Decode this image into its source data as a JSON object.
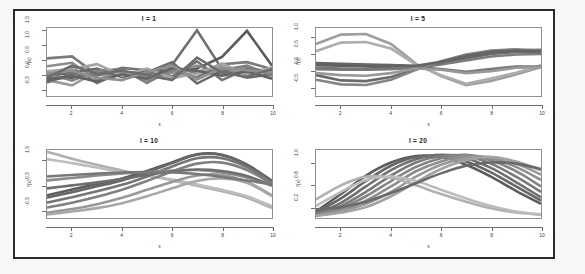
{
  "figure": {
    "layout": "2x2 grid of line plots",
    "background": "#ffffff",
    "frame_color": "#2b2b2b"
  },
  "chart_data": [
    {
      "type": "line",
      "title": "l = 1",
      "xlabel": "x",
      "ylabel": "f(x)",
      "xlim": [
        1,
        10
      ],
      "ylim": [
        -0.75,
        1.6
      ],
      "xticks": [
        "2",
        "4",
        "6",
        "8",
        "10"
      ],
      "xtick_values": [
        2,
        4,
        6,
        8,
        10
      ],
      "yticks": [
        "-0.5",
        "0.0",
        "0.5",
        "1.0",
        "1.5"
      ],
      "ytick_values": [
        -0.5,
        0.0,
        0.5,
        1.0,
        1.5
      ],
      "grid": false,
      "legend": "none",
      "x": [
        1,
        2,
        3,
        4,
        5,
        6,
        7,
        8,
        9,
        10
      ],
      "series": [
        {
          "name": "draw-1",
          "color": "#6f6f6f",
          "values": [
            -0.1,
            0.22,
            -0.3,
            0.1,
            -0.05,
            0.32,
            1.52,
            0.18,
            0.05,
            0.1
          ]
        },
        {
          "name": "draw-2",
          "color": "#5a5a5a",
          "values": [
            -0.15,
            -0.12,
            0.05,
            -0.02,
            0.12,
            0.08,
            0.2,
            0.6,
            1.5,
            0.3
          ]
        },
        {
          "name": "draw-3",
          "color": "#7a7a7a",
          "values": [
            0.55,
            0.62,
            -0.02,
            0.05,
            0.02,
            0.1,
            -0.1,
            0.35,
            0.42,
            0.18
          ]
        },
        {
          "name": "draw-4",
          "color": "#8c8c8c",
          "values": [
            0.28,
            0.4,
            -0.18,
            0.08,
            -0.2,
            0.05,
            0.3,
            0.02,
            0.22,
            0.05
          ]
        },
        {
          "name": "draw-5",
          "color": "#9b9b9b",
          "values": [
            -0.2,
            -0.38,
            0.1,
            0.02,
            -0.08,
            -0.15,
            0.1,
            0.26,
            0.05,
            0.2
          ]
        },
        {
          "name": "draw-6",
          "color": "#6a6a6a",
          "values": [
            -0.05,
            0.05,
            0.2,
            -0.1,
            0.06,
            0.42,
            -0.32,
            0.12,
            -0.12,
            0.0
          ]
        },
        {
          "name": "draw-7",
          "color": "#808080",
          "values": [
            0.05,
            -0.22,
            0.12,
            0.18,
            -0.3,
            0.18,
            0.08,
            0.15,
            0.3,
            -0.05
          ]
        },
        {
          "name": "draw-8",
          "color": "#747474",
          "values": [
            -0.28,
            0.02,
            -0.05,
            0.22,
            0.14,
            -0.08,
            0.45,
            -0.2,
            0.18,
            0.12
          ]
        },
        {
          "name": "draw-9",
          "color": "#a4a4a4",
          "values": [
            0.1,
            0.18,
            0.35,
            -0.05,
            0.2,
            -0.12,
            0.02,
            0.38,
            -0.02,
            0.24
          ]
        },
        {
          "name": "draw-10",
          "color": "#636363",
          "values": [
            -0.22,
            -0.05,
            -0.25,
            0.0,
            -0.15,
            0.22,
            0.12,
            -0.05,
            0.1,
            -0.15
          ]
        },
        {
          "name": "draw-11",
          "color": "#8f8f8f",
          "values": [
            0.02,
            0.12,
            -0.12,
            -0.2,
            0.08,
            0.3,
            -0.18,
            0.22,
            0.14,
            0.06
          ]
        },
        {
          "name": "draw-12",
          "color": "#6d6d6d",
          "values": [
            -0.12,
            0.3,
            0.02,
            0.12,
            -0.02,
            -0.2,
            0.58,
            0.05,
            -0.08,
            0.18
          ]
        }
      ]
    },
    {
      "type": "line",
      "title": "l = 5",
      "xlabel": "x",
      "ylabel": "f(x)",
      "xlim": [
        1,
        10
      ],
      "ylim": [
        -0.75,
        1.3
      ],
      "xticks": [
        "2",
        "4",
        "6",
        "8",
        "10"
      ],
      "xtick_values": [
        2,
        4,
        6,
        8,
        10
      ],
      "yticks": [
        "-0.5",
        "0.0",
        "0.5",
        "1.0"
      ],
      "ytick_values": [
        -0.5,
        0.0,
        0.5,
        1.0
      ],
      "grid": false,
      "legend": "none",
      "x": [
        1,
        2,
        3,
        4,
        5,
        6,
        7,
        8,
        9,
        10
      ],
      "series": [
        {
          "name": "draw-1",
          "color": "#9e9e9e",
          "values": [
            0.82,
            1.1,
            1.12,
            0.82,
            0.22,
            -0.15,
            -0.42,
            -0.3,
            -0.1,
            0.12
          ]
        },
        {
          "name": "draw-2",
          "color": "#adadad",
          "values": [
            0.6,
            0.86,
            0.88,
            0.68,
            0.2,
            -0.12,
            -0.38,
            -0.22,
            -0.05,
            0.18
          ]
        },
        {
          "name": "draw-3",
          "color": "#707070",
          "values": [
            0.22,
            0.2,
            0.18,
            0.16,
            0.14,
            0.22,
            0.38,
            0.52,
            0.58,
            0.6
          ]
        },
        {
          "name": "draw-4",
          "color": "#5e5e5e",
          "values": [
            0.18,
            0.16,
            0.14,
            0.12,
            0.1,
            0.24,
            0.42,
            0.56,
            0.62,
            0.64
          ]
        },
        {
          "name": "draw-5",
          "color": "#7d7d7d",
          "values": [
            0.06,
            0.04,
            0.04,
            0.06,
            0.1,
            0.2,
            0.32,
            0.44,
            0.5,
            0.52
          ]
        },
        {
          "name": "draw-6",
          "color": "#6a6a6a",
          "values": [
            -0.12,
            -0.28,
            -0.3,
            -0.18,
            0.06,
            0.26,
            0.44,
            0.56,
            0.6,
            0.58
          ]
        },
        {
          "name": "draw-7",
          "color": "#858585",
          "values": [
            -0.26,
            -0.4,
            -0.42,
            -0.26,
            0.04,
            0.3,
            0.5,
            0.62,
            0.66,
            0.62
          ]
        },
        {
          "name": "draw-8",
          "color": "#767676",
          "values": [
            0.1,
            0.08,
            0.06,
            0.08,
            0.12,
            0.06,
            -0.02,
            0.06,
            0.14,
            0.14
          ]
        },
        {
          "name": "draw-9",
          "color": "#999999",
          "values": [
            -0.06,
            -0.12,
            -0.14,
            -0.06,
            0.08,
            0.04,
            -0.06,
            0.0,
            0.1,
            0.12
          ]
        },
        {
          "name": "draw-10",
          "color": "#646464",
          "values": [
            0.24,
            0.22,
            0.2,
            0.18,
            0.16,
            0.28,
            0.46,
            0.58,
            0.62,
            0.6
          ]
        }
      ]
    },
    {
      "type": "line",
      "title": "l = 10",
      "xlabel": "x",
      "ylabel": "f(x)",
      "xlim": [
        1,
        10
      ],
      "ylim": [
        -0.8,
        1.95
      ],
      "xticks": [
        "2",
        "4",
        "6",
        "8",
        "10"
      ],
      "xtick_values": [
        2,
        4,
        6,
        8,
        10
      ],
      "yticks": [
        "-0.5",
        "0.5",
        "1.5"
      ],
      "ytick_values": [
        -0.5,
        0.5,
        1.5
      ],
      "grid": false,
      "legend": "none",
      "x": [
        1,
        2,
        3,
        4,
        5,
        6,
        7,
        8,
        9,
        10
      ],
      "series": [
        {
          "name": "draw-1",
          "color": "#b0b0b0",
          "values": [
            1.88,
            1.6,
            1.35,
            1.12,
            0.92,
            0.72,
            0.5,
            0.28,
            0.02,
            -0.4
          ]
        },
        {
          "name": "draw-2",
          "color": "#bdbdbd",
          "values": [
            1.58,
            1.42,
            1.24,
            1.06,
            0.92,
            0.76,
            0.56,
            0.34,
            0.08,
            -0.32
          ]
        },
        {
          "name": "draw-3",
          "color": "#5c5c5c",
          "values": [
            0.12,
            0.35,
            0.58,
            0.8,
            1.1,
            1.45,
            1.78,
            1.76,
            1.36,
            0.7
          ]
        },
        {
          "name": "draw-4",
          "color": "#666666",
          "values": [
            0.02,
            0.24,
            0.48,
            0.72,
            1.04,
            1.42,
            1.76,
            1.74,
            1.34,
            0.66
          ]
        },
        {
          "name": "draw-5",
          "color": "#757575",
          "values": [
            -0.18,
            0.04,
            0.28,
            0.54,
            0.88,
            1.28,
            1.62,
            1.62,
            1.26,
            0.62
          ]
        },
        {
          "name": "draw-6",
          "color": "#808080",
          "values": [
            -0.38,
            -0.18,
            0.06,
            0.34,
            0.7,
            1.08,
            1.4,
            1.44,
            1.14,
            0.58
          ]
        },
        {
          "name": "draw-7",
          "color": "#8c8c8c",
          "values": [
            0.72,
            0.82,
            0.92,
            1.0,
            1.06,
            1.12,
            1.14,
            1.04,
            0.84,
            0.54
          ]
        },
        {
          "name": "draw-8",
          "color": "#6e6e6e",
          "values": [
            0.4,
            0.52,
            0.64,
            0.78,
            0.94,
            1.08,
            1.16,
            1.1,
            0.9,
            0.5
          ]
        },
        {
          "name": "draw-9",
          "color": "#989898",
          "values": [
            -0.58,
            -0.44,
            -0.24,
            0.02,
            0.34,
            0.66,
            0.92,
            0.94,
            0.66,
            0.12
          ]
        },
        {
          "name": "draw-10",
          "color": "#a8a8a8",
          "values": [
            -0.66,
            -0.54,
            -0.4,
            -0.2,
            0.08,
            0.4,
            0.7,
            0.8,
            0.62,
            0.08
          ]
        },
        {
          "name": "draw-11",
          "color": "#787878",
          "values": [
            0.88,
            0.94,
            1.0,
            1.04,
            1.06,
            1.04,
            0.98,
            0.86,
            0.72,
            0.56
          ]
        }
      ]
    },
    {
      "type": "line",
      "title": "l = 20",
      "xlabel": "x",
      "ylabel": "f(x)",
      "xlim": [
        1,
        10
      ],
      "ylim": [
        0.0,
        1.25
      ],
      "xticks": [
        "2",
        "4",
        "6",
        "8",
        "10"
      ],
      "xtick_values": [
        2,
        4,
        6,
        8,
        10
      ],
      "yticks": [
        "0.2",
        "0.6",
        "1.0"
      ],
      "ytick_values": [
        0.2,
        0.6,
        1.0
      ],
      "grid": false,
      "legend": "none",
      "x": [
        1,
        2,
        3,
        4,
        5,
        6,
        7,
        8,
        9,
        10
      ],
      "series": [
        {
          "name": "draw-1",
          "color": "#5c5c5c",
          "values": [
            0.12,
            0.44,
            0.78,
            1.02,
            1.14,
            1.12,
            0.98,
            0.76,
            0.5,
            0.26
          ]
        },
        {
          "name": "draw-2",
          "color": "#666666",
          "values": [
            0.1,
            0.36,
            0.68,
            0.96,
            1.12,
            1.14,
            1.04,
            0.84,
            0.58,
            0.32
          ]
        },
        {
          "name": "draw-3",
          "color": "#707070",
          "values": [
            0.08,
            0.28,
            0.58,
            0.88,
            1.08,
            1.16,
            1.1,
            0.92,
            0.66,
            0.38
          ]
        },
        {
          "name": "draw-4",
          "color": "#7a7a7a",
          "values": [
            0.06,
            0.22,
            0.48,
            0.78,
            1.02,
            1.14,
            1.14,
            1.0,
            0.76,
            0.48
          ]
        },
        {
          "name": "draw-5",
          "color": "#848484",
          "values": [
            0.06,
            0.18,
            0.4,
            0.68,
            0.94,
            1.1,
            1.16,
            1.06,
            0.86,
            0.58
          ]
        },
        {
          "name": "draw-6",
          "color": "#8e8e8e",
          "values": [
            0.05,
            0.14,
            0.32,
            0.58,
            0.86,
            1.04,
            1.14,
            1.1,
            0.94,
            0.7
          ]
        },
        {
          "name": "draw-7",
          "color": "#989898",
          "values": [
            0.04,
            0.12,
            0.26,
            0.48,
            0.76,
            0.98,
            1.1,
            1.12,
            1.0,
            0.8
          ]
        },
        {
          "name": "draw-8",
          "color": "#a2a2a2",
          "values": [
            0.04,
            0.1,
            0.2,
            0.4,
            0.66,
            0.9,
            1.06,
            1.12,
            1.04,
            0.88
          ]
        },
        {
          "name": "draw-9",
          "color": "#b0b0b0",
          "values": [
            0.34,
            0.6,
            0.76,
            0.74,
            0.6,
            0.44,
            0.3,
            0.18,
            0.1,
            0.06
          ]
        },
        {
          "name": "draw-10",
          "color": "#bcbcbc",
          "values": [
            0.22,
            0.48,
            0.7,
            0.76,
            0.68,
            0.52,
            0.36,
            0.22,
            0.12,
            0.07
          ]
        },
        {
          "name": "draw-11",
          "color": "#6a6a6a",
          "values": [
            0.16,
            0.2,
            0.3,
            0.46,
            0.64,
            0.82,
            0.96,
            1.02,
            1.0,
            0.9
          ]
        }
      ]
    }
  ]
}
